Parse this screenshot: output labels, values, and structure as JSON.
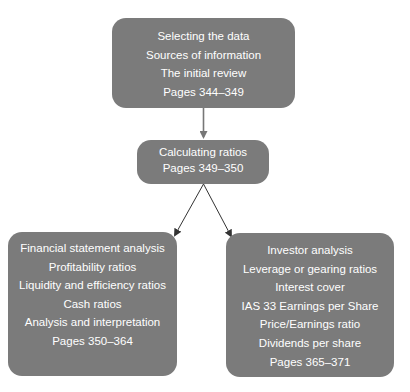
{
  "diagram": {
    "type": "flowchart",
    "colors": {
      "box_fill": "#7b7b7b",
      "box_text": "#ffffff",
      "arrow_top": "#777777",
      "arrow_bottom": "#333333"
    },
    "nodes": {
      "top": {
        "lines": [
          "Selecting the data",
          "Sources of information",
          "The initial review",
          "Pages 344–349"
        ]
      },
      "middle": {
        "lines": [
          "Calculating ratios",
          "Pages 349–350"
        ]
      },
      "left": {
        "lines": [
          "Financial statement analysis",
          "Profitability ratios",
          "Liquidity and efficiency ratios",
          "Cash ratios",
          "Analysis and interpretation",
          "Pages 350–364"
        ]
      },
      "right": {
        "lines": [
          "Investor analysis",
          "Leverage or gearing ratios",
          "Interest cover",
          "IAS 33 Earnings per Share",
          "Price/Earnings ratio",
          "Dividends per share",
          "Pages 365–371"
        ]
      }
    },
    "edges": [
      {
        "from": "top",
        "to": "middle"
      },
      {
        "from": "middle",
        "to": "left"
      },
      {
        "from": "middle",
        "to": "right"
      }
    ]
  }
}
